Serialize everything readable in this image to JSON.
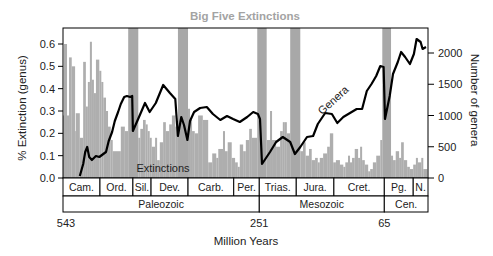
{
  "chart_data": {
    "type": "bar+line",
    "title": "Big Five Extinctions",
    "xlabel": "Million Years",
    "ylabel": "% Extinction (genus)",
    "y2label": "Number of genera",
    "xlim": [
      543,
      0
    ],
    "ylim": [
      0,
      0.6
    ],
    "y2lim": [
      0,
      2000
    ],
    "x_ticks": [
      {
        "value": 543,
        "label": "543"
      },
      {
        "value": 251,
        "label": "251"
      },
      {
        "value": 65,
        "label": "65"
      }
    ],
    "y_ticks": [
      {
        "value": 0.0,
        "label": "0.0"
      },
      {
        "value": 0.1,
        "label": "0.1"
      },
      {
        "value": 0.2,
        "label": "0.2"
      },
      {
        "value": 0.3,
        "label": "0.3"
      },
      {
        "value": 0.4,
        "label": "0.4"
      },
      {
        "value": 0.5,
        "label": "0.5"
      },
      {
        "value": 0.6,
        "label": "0.6"
      }
    ],
    "y2_ticks": [
      {
        "value": 0,
        "label": "0"
      },
      {
        "value": 500,
        "label": "500"
      },
      {
        "value": 1000,
        "label": "1000"
      },
      {
        "value": 1500,
        "label": "1500"
      },
      {
        "value": 2000,
        "label": "2000"
      }
    ],
    "grid": false,
    "legend": "none",
    "annotations": [
      {
        "text": "Extinctions",
        "series": "extinctions"
      },
      {
        "text": "Genera",
        "series": "genera"
      }
    ],
    "colors": {
      "bars": "#aeaeae",
      "bands": "#a8a8a8",
      "line": "#000000",
      "title": "#a3a3a3"
    },
    "mass_extinction_bands": [
      {
        "start": 446,
        "end": 431
      },
      {
        "start": 372,
        "end": 357
      },
      {
        "start": 254,
        "end": 240
      },
      {
        "start": 205,
        "end": 190
      },
      {
        "start": 68,
        "end": 55
      }
    ],
    "series": [
      {
        "name": "Extinctions",
        "type": "bar",
        "axis": "left",
        "unit": "fraction of genera",
        "bars_start_end_value": [
          [
            543,
            541.5,
            0.28
          ],
          [
            541.5,
            537,
            0.6
          ],
          [
            537,
            534,
            0.28
          ],
          [
            534,
            530,
            0.54
          ],
          [
            530,
            525,
            0.5
          ],
          [
            525,
            524,
            0.21
          ],
          [
            524,
            518,
            0.29
          ],
          [
            518,
            513,
            0.18
          ],
          [
            513,
            509,
            0.52
          ],
          [
            509,
            506,
            0.32
          ],
          [
            506,
            503,
            0.43
          ],
          [
            503,
            500,
            0.61
          ],
          [
            500,
            497,
            0.44
          ],
          [
            497,
            494,
            0.38
          ],
          [
            494,
            489,
            0.53
          ],
          [
            489,
            486,
            0.48
          ],
          [
            486,
            483,
            0.43
          ],
          [
            483,
            479,
            0.36
          ],
          [
            479,
            476,
            0.3
          ],
          [
            476,
            472,
            0.23
          ],
          [
            472,
            469,
            0.17
          ],
          [
            469,
            457,
            0.12
          ],
          [
            457,
            451,
            0.23
          ],
          [
            451,
            446,
            0.21
          ],
          [
            431,
            428,
            0.18
          ],
          [
            428,
            424,
            0.22
          ],
          [
            424,
            420,
            0.26
          ],
          [
            420,
            417,
            0.24
          ],
          [
            417,
            414,
            0.21
          ],
          [
            414,
            411,
            0.18
          ],
          [
            411,
            406,
            0.14
          ],
          [
            406,
            403,
            0.18
          ],
          [
            403,
            399,
            0.08
          ],
          [
            399,
            394,
            0.16
          ],
          [
            394,
            390,
            0.25
          ],
          [
            390,
            385,
            0.21
          ],
          [
            385,
            381,
            0.24
          ],
          [
            381,
            376,
            0.28
          ],
          [
            376,
            372,
            0.23
          ],
          [
            357,
            354,
            0.31
          ],
          [
            354,
            351,
            0.26
          ],
          [
            351,
            347,
            0.21
          ],
          [
            347,
            342,
            0.2
          ],
          [
            342,
            335,
            0.28
          ],
          [
            335,
            327,
            0.26
          ],
          [
            327,
            321,
            0.07
          ],
          [
            321,
            315,
            0.11
          ],
          [
            315,
            312,
            0.09
          ],
          [
            312,
            305,
            0.13
          ],
          [
            305,
            302,
            0.21
          ],
          [
            302,
            298,
            0.12
          ],
          [
            298,
            292,
            0.16
          ],
          [
            292,
            287,
            0.09
          ],
          [
            287,
            283,
            0.07
          ],
          [
            283,
            280,
            0.05
          ],
          [
            280,
            275,
            0.15
          ],
          [
            275,
            271,
            0.12
          ],
          [
            271,
            266,
            0.17
          ],
          [
            266,
            262,
            0.22
          ],
          [
            262,
            254,
            0.18
          ],
          [
            240,
            235,
            0.17
          ],
          [
            235,
            232,
            0.3
          ],
          [
            232,
            226,
            0.17
          ],
          [
            226,
            220,
            0.14
          ],
          [
            220,
            216,
            0.21
          ],
          [
            216,
            213,
            0.25
          ],
          [
            213,
            210,
            0.25
          ],
          [
            210,
            205,
            0.2
          ],
          [
            190,
            186,
            0.12
          ],
          [
            186,
            182,
            0.16
          ],
          [
            182,
            177,
            0.1
          ],
          [
            177,
            173,
            0.13
          ],
          [
            173,
            168,
            0.08
          ],
          [
            168,
            164,
            0.09
          ],
          [
            164,
            161,
            0.07
          ],
          [
            161,
            156,
            0.09
          ],
          [
            156,
            150,
            0.11
          ],
          [
            150,
            146,
            0.14
          ],
          [
            146,
            141,
            0.2
          ],
          [
            141,
            137,
            0.07
          ],
          [
            137,
            131,
            0.08
          ],
          [
            131,
            126,
            0.06
          ],
          [
            126,
            123,
            0.05
          ],
          [
            123,
            119,
            0.07
          ],
          [
            119,
            116,
            0.1
          ],
          [
            116,
            113,
            0.07
          ],
          [
            113,
            109,
            0.09
          ],
          [
            109,
            104,
            0.13
          ],
          [
            104,
            101,
            0.09
          ],
          [
            101,
            98,
            0.14
          ],
          [
            98,
            94,
            0.08
          ],
          [
            94,
            89,
            0.06
          ],
          [
            89,
            86,
            0.03
          ],
          [
            86,
            82,
            0.04
          ],
          [
            82,
            77,
            0.07
          ],
          [
            77,
            71,
            0.1
          ],
          [
            71,
            68,
            0.17
          ],
          [
            55,
            52,
            0.1
          ],
          [
            52,
            48,
            0.08
          ],
          [
            48,
            43,
            0.12
          ],
          [
            43,
            40,
            0.09
          ],
          [
            40,
            36,
            0.16
          ],
          [
            36,
            31,
            0.08
          ],
          [
            31,
            27,
            0.05
          ],
          [
            27,
            22,
            0.04
          ],
          [
            22,
            18,
            0.06
          ],
          [
            18,
            15,
            0.09
          ],
          [
            15,
            10,
            0.07
          ],
          [
            10,
            7,
            0.09
          ],
          [
            7,
            1,
            0.04
          ]
        ]
      },
      {
        "name": "Genera",
        "type": "line",
        "axis": "right",
        "unit": "number of genera",
        "points_ma_value": [
          [
            518,
            32
          ],
          [
            513,
            224
          ],
          [
            510,
            416
          ],
          [
            507,
            496
          ],
          [
            504,
            336
          ],
          [
            500,
            288
          ],
          [
            494,
            352
          ],
          [
            489,
            336
          ],
          [
            483,
            384
          ],
          [
            479,
            416
          ],
          [
            475,
            592
          ],
          [
            470,
            736
          ],
          [
            466,
            912
          ],
          [
            461,
            1056
          ],
          [
            457,
            1184
          ],
          [
            452,
            1296
          ],
          [
            448,
            1312
          ],
          [
            443,
            1296
          ],
          [
            440,
            1312
          ],
          [
            439,
            752
          ],
          [
            430,
            976
          ],
          [
            421,
            1200
          ],
          [
            414,
            1056
          ],
          [
            405,
            1200
          ],
          [
            394,
            1488
          ],
          [
            384,
            1360
          ],
          [
            376,
            1264
          ],
          [
            372,
            672
          ],
          [
            367,
            976
          ],
          [
            363,
            848
          ],
          [
            358,
            608
          ],
          [
            354,
            912
          ],
          [
            348,
            1056
          ],
          [
            339,
            1120
          ],
          [
            329,
            1136
          ],
          [
            320,
            1024
          ],
          [
            309,
            928
          ],
          [
            299,
            992
          ],
          [
            290,
            944
          ],
          [
            280,
            896
          ],
          [
            269,
            976
          ],
          [
            260,
            1056
          ],
          [
            253,
            1024
          ],
          [
            250,
            944
          ],
          [
            247,
            224
          ],
          [
            235,
            416
          ],
          [
            226,
            576
          ],
          [
            216,
            656
          ],
          [
            205,
            576
          ],
          [
            198,
            384
          ],
          [
            190,
            496
          ],
          [
            180,
            656
          ],
          [
            171,
            672
          ],
          [
            164,
            864
          ],
          [
            153,
            1040
          ],
          [
            143,
            1024
          ],
          [
            135,
            880
          ],
          [
            126,
            976
          ],
          [
            116,
            1040
          ],
          [
            106,
            1104
          ],
          [
            98,
            1104
          ],
          [
            91,
            1392
          ],
          [
            84,
            1504
          ],
          [
            77,
            1632
          ],
          [
            71,
            1792
          ],
          [
            66,
            1776
          ],
          [
            64,
            944
          ],
          [
            57,
            1312
          ],
          [
            52,
            1664
          ],
          [
            45,
            1856
          ],
          [
            40,
            2016
          ],
          [
            34,
            1936
          ],
          [
            27,
            1824
          ],
          [
            21,
            1984
          ],
          [
            17,
            2224
          ],
          [
            11,
            2176
          ],
          [
            8,
            2064
          ],
          [
            3,
            2096
          ]
        ]
      }
    ],
    "periods": [
      {
        "label": "Cam.",
        "start": 543,
        "end": 488
      },
      {
        "label": "Ord.",
        "start": 488,
        "end": 439
      },
      {
        "label": "Sil.",
        "start": 439,
        "end": 412
      },
      {
        "label": "Dev.",
        "start": 412,
        "end": 357
      },
      {
        "label": "Carb.",
        "start": 357,
        "end": 289
      },
      {
        "label": "Per.",
        "start": 289,
        "end": 251
      },
      {
        "label": "Trias.",
        "start": 251,
        "end": 196
      },
      {
        "label": "Jura.",
        "start": 196,
        "end": 140
      },
      {
        "label": "Cret.",
        "start": 140,
        "end": 65
      },
      {
        "label": "Pg.",
        "start": 65,
        "end": 22
      },
      {
        "label": "N.",
        "start": 22,
        "end": 0
      }
    ],
    "eras": [
      {
        "label": "Paleozoic",
        "start": 543,
        "end": 251
      },
      {
        "label": "Mesozoic",
        "start": 251,
        "end": 65
      },
      {
        "label": "Cen.",
        "start": 65,
        "end": 0
      }
    ]
  }
}
